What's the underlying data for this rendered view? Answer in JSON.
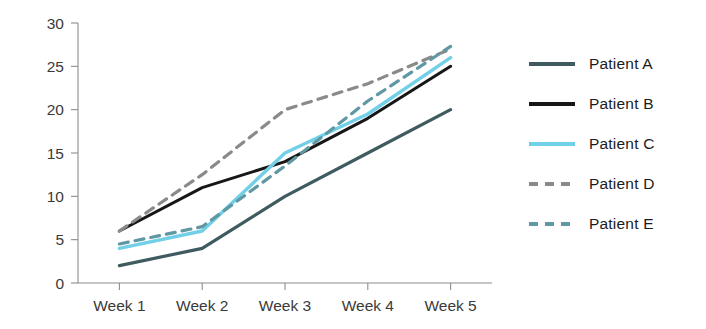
{
  "chart_data": {
    "type": "line",
    "title": "",
    "xlabel": "",
    "ylabel": "",
    "categories": [
      "Week 1",
      "Week 2",
      "Week 3",
      "Week 4",
      "Week 5"
    ],
    "ylim": [
      0,
      30
    ],
    "yticks": [
      0,
      5,
      10,
      15,
      20,
      25,
      30
    ],
    "grid": false,
    "legend_position": "right",
    "series": [
      {
        "name": "Patient A",
        "values": [
          2,
          4,
          10,
          15,
          20
        ],
        "color": "#3f5b60",
        "style": "solid",
        "width": 3.2
      },
      {
        "name": "Patient B",
        "values": [
          6,
          11,
          14,
          19,
          25
        ],
        "color": "#171717",
        "style": "solid",
        "width": 3.0
      },
      {
        "name": "Patient C",
        "values": [
          4,
          6,
          15,
          19.5,
          26
        ],
        "color": "#72cfe8",
        "style": "solid",
        "width": 3.4
      },
      {
        "name": "Patient D",
        "values": [
          6,
          12.5,
          20,
          23,
          27
        ],
        "color": "#8a8a8a",
        "style": "dashed",
        "width": 3.2
      },
      {
        "name": "Patient E",
        "values": [
          4.5,
          6.5,
          13.5,
          21,
          27.3
        ],
        "color": "#5f97a3",
        "style": "dashed",
        "width": 3.2
      }
    ]
  },
  "legend": {
    "items": [
      {
        "label": "Patient A"
      },
      {
        "label": "Patient B"
      },
      {
        "label": "Patient C"
      },
      {
        "label": "Patient D"
      },
      {
        "label": "Patient E"
      }
    ]
  },
  "axes": {
    "y_tick_labels": [
      "30",
      "25",
      "20",
      "15",
      "10",
      "5",
      "0"
    ],
    "x_tick_labels": [
      "Week 1",
      "Week 2",
      "Week 3",
      "Week 4",
      "Week 5"
    ],
    "axis_color": "#8d8d8d"
  }
}
